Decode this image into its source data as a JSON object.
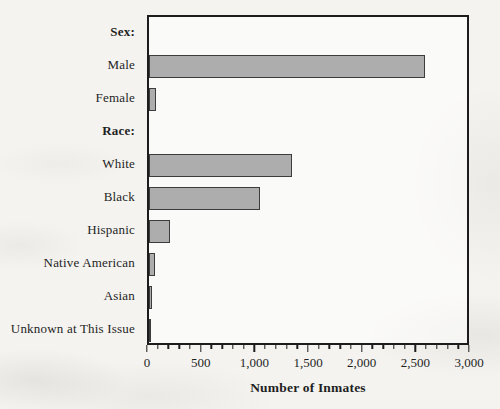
{
  "figure": {
    "background": "#f4f3ef"
  },
  "chart_data": {
    "type": "bar",
    "orientation": "horizontal",
    "title": "",
    "xlabel": "Number of Inmates",
    "ylabel": "",
    "categories": [
      "Sex:",
      "Male",
      "Female",
      "Race:",
      "White",
      "Black",
      "Hispanic",
      "Native American",
      "Asian",
      "Unknown at This Issue"
    ],
    "values": [
      null,
      2600,
      70,
      null,
      1350,
      1050,
      200,
      60,
      30,
      15
    ],
    "header_rows": [
      0,
      3
    ],
    "xlim": [
      0,
      3000
    ],
    "x_ticks": [
      0,
      500,
      1000,
      1500,
      2000,
      2500,
      3000
    ],
    "x_tick_labels": [
      "0",
      "500",
      "1,000",
      "1,500",
      "2,000",
      "2,500",
      "3,000"
    ],
    "minor_tick_step": 100,
    "grid": "off",
    "legend": "none",
    "bar_color": "#adadad",
    "bar_border_color": "#3c3c3c",
    "axis_color": "#1c1c1c"
  }
}
